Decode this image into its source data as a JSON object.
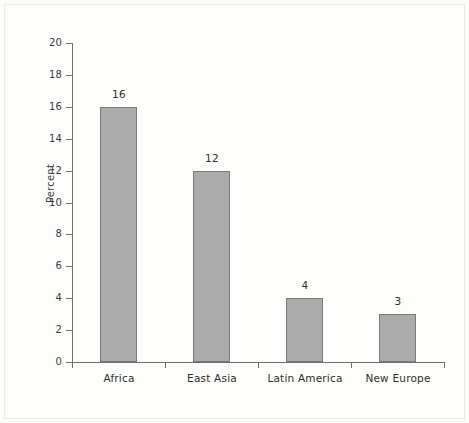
{
  "chart_data": {
    "type": "bar",
    "title": "",
    "xlabel": "",
    "ylabel": "Percent",
    "categories": [
      "Africa",
      "East Asia",
      "Latin America",
      "New Europe"
    ],
    "values": [
      16,
      12,
      4,
      3
    ],
    "value_labels": [
      "16",
      "12",
      "4",
      "3"
    ],
    "ylim": [
      0,
      20
    ],
    "ytick_values": [
      0,
      2,
      4,
      6,
      8,
      10,
      12,
      14,
      16,
      18,
      20
    ],
    "ytick_labels": [
      "0",
      "2",
      "4",
      "6",
      "8",
      "10",
      "12",
      "14",
      "16",
      "18",
      "20"
    ],
    "grid": false,
    "legend": "none",
    "bar_color": "#ababab",
    "bar_border_color": "#7a7a7a",
    "axis_color": "#6e6e6e",
    "text_color": "#2e2e2e",
    "background_color": "#fdfdfc"
  }
}
